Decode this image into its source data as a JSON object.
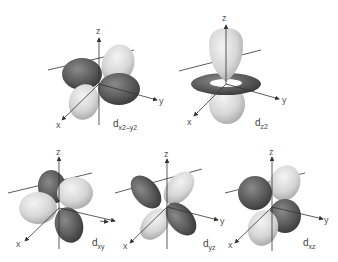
{
  "colors": {
    "dark_lobe": "#5a5a5a",
    "light_lobe": "#d9d9d9",
    "axis": "#333333",
    "background": "#ffffff"
  },
  "axis_labels": {
    "x": "x",
    "y": "y",
    "z": "z"
  },
  "orbitals": [
    {
      "id": "dx2-y2",
      "base": "d",
      "subscript": "x2–y2",
      "label": "dx2–y2"
    },
    {
      "id": "dz2",
      "base": "d",
      "subscript": "z2",
      "label": "dz2"
    },
    {
      "id": "dxy",
      "base": "d",
      "subscript": "xy",
      "label": "dxy"
    },
    {
      "id": "dyz",
      "base": "d",
      "subscript": "yz",
      "label": "dyz"
    },
    {
      "id": "dxz",
      "base": "d",
      "subscript": "xz",
      "label": "dxz"
    }
  ]
}
